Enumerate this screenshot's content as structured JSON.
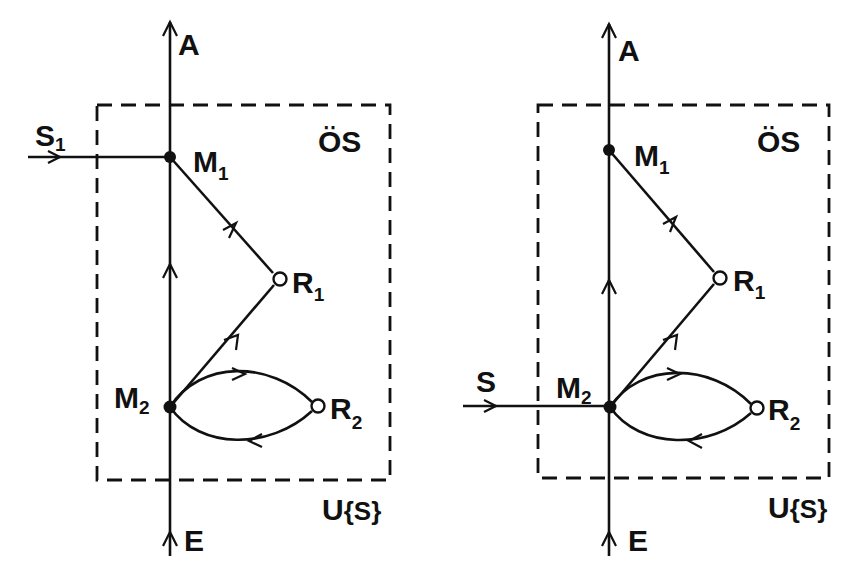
{
  "diagrams": [
    {
      "id": "left",
      "labels": {
        "axis_top": "A",
        "axis_bottom": "E",
        "upper_system": "ÖS",
        "lower_system_main": "U",
        "lower_system_bracket": "{S}",
        "input": "S",
        "input_sub": "1",
        "m1": "M",
        "m1_sub": "1",
        "m2": "M",
        "m2_sub": "2",
        "r1": "R",
        "r1_sub": "1",
        "r2": "R",
        "r2_sub": "2"
      },
      "input_attaches_to": "M1"
    },
    {
      "id": "right",
      "labels": {
        "axis_top": "A",
        "axis_bottom": "E",
        "upper_system": "ÖS",
        "lower_system_main": "U",
        "lower_system_bracket": "{S}",
        "input": "S",
        "input_sub": "",
        "m1": "M",
        "m1_sub": "1",
        "m2": "M",
        "m2_sub": "2",
        "r1": "R",
        "r1_sub": "1",
        "r2": "R",
        "r2_sub": "2"
      },
      "input_attaches_to": "M2"
    }
  ],
  "nodes": {
    "filled": [
      "M1",
      "M2"
    ],
    "open": [
      "R1",
      "R2"
    ]
  },
  "edges": [
    {
      "from": "E",
      "to": "M2",
      "type": "axis"
    },
    {
      "from": "M2",
      "to": "M1",
      "type": "axis"
    },
    {
      "from": "M1",
      "to": "A",
      "type": "axis"
    },
    {
      "from": "M2",
      "to": "R1",
      "type": "straight"
    },
    {
      "from": "R1",
      "to": "M1",
      "type": "straight"
    },
    {
      "from": "M2",
      "to": "R2",
      "type": "curved-upper"
    },
    {
      "from": "R2",
      "to": "M2",
      "type": "curved-lower"
    }
  ],
  "colors": {
    "ink": "#111111",
    "background": "#ffffff"
  }
}
